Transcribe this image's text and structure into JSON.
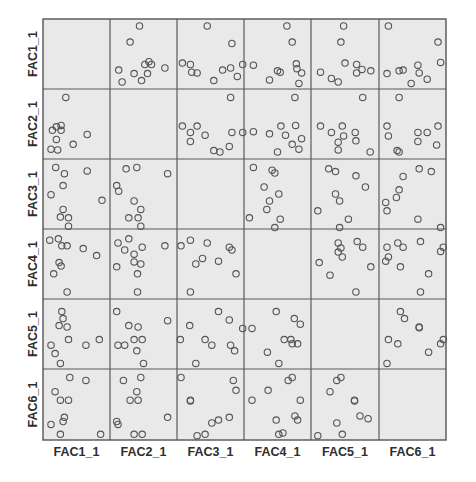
{
  "chart_data": {
    "type": "scatter",
    "subtype": "scatterplot-matrix",
    "title": "",
    "variables": [
      "FAC1_1",
      "FAC2_1",
      "FAC3_1",
      "FAC4_1",
      "FAC5_1",
      "FAC6_1"
    ],
    "x_labels": [
      "FAC1_1",
      "FAC2_1",
      "FAC3_1",
      "FAC4_1",
      "FAC5_1",
      "FAC6_1"
    ],
    "y_labels": [
      "FAC1_1",
      "FAC2_1",
      "FAC3_1",
      "FAC4_1",
      "FAC5_1",
      "FAC6_1"
    ],
    "grid": true,
    "legend": "none",
    "marker": "open-circle",
    "diagonal": "empty",
    "layout": {
      "left": 43,
      "top": 19,
      "col_edges": [
        43,
        110,
        177,
        244,
        311,
        379,
        446
      ],
      "row_edges": [
        19,
        89,
        159,
        229,
        299,
        369,
        440
      ]
    },
    "colors": {
      "cell_bg": "#e9e9e9",
      "marker": "#555555",
      "grid": "#5a5a5a",
      "label": "#2e2e2e"
    },
    "cells": {
      "0-1": [
        [
          0.13,
          0.73
        ],
        [
          0.3,
          0.33
        ],
        [
          0.44,
          0.1
        ],
        [
          0.18,
          0.9
        ],
        [
          0.36,
          0.78
        ],
        [
          0.47,
          0.88
        ],
        [
          0.52,
          0.65
        ],
        [
          0.58,
          0.61
        ],
        [
          0.62,
          0.65
        ],
        [
          0.56,
          0.78
        ],
        [
          0.82,
          0.7
        ]
      ],
      "0-2": [
        [
          0.08,
          0.63
        ],
        [
          0.2,
          0.65
        ],
        [
          0.22,
          0.76
        ],
        [
          0.3,
          0.77
        ],
        [
          0.45,
          0.1
        ],
        [
          0.55,
          0.88
        ],
        [
          0.68,
          0.73
        ],
        [
          0.82,
          0.35
        ],
        [
          0.8,
          0.7
        ],
        [
          0.9,
          0.82
        ],
        [
          0.98,
          0.65
        ]
      ],
      "0-3": [
        [
          0.14,
          0.66
        ],
        [
          0.38,
          0.87
        ],
        [
          0.5,
          0.74
        ],
        [
          0.54,
          0.76
        ],
        [
          0.64,
          0.1
        ],
        [
          0.72,
          0.33
        ],
        [
          0.78,
          0.64
        ],
        [
          0.79,
          0.71
        ],
        [
          0.86,
          0.77
        ],
        [
          0.82,
          0.92
        ]
      ],
      "0-4": [
        [
          0.14,
          0.76
        ],
        [
          0.3,
          0.85
        ],
        [
          0.4,
          0.9
        ],
        [
          0.48,
          0.1
        ],
        [
          0.44,
          0.33
        ],
        [
          0.5,
          0.63
        ],
        [
          0.67,
          0.65
        ],
        [
          0.67,
          0.77
        ],
        [
          0.75,
          0.72
        ],
        [
          0.88,
          0.74
        ]
      ],
      "0-5": [
        [
          0.14,
          0.1
        ],
        [
          0.12,
          0.78
        ],
        [
          0.3,
          0.74
        ],
        [
          0.36,
          0.73
        ],
        [
          0.58,
          0.66
        ],
        [
          0.6,
          0.77
        ],
        [
          0.72,
          0.86
        ],
        [
          0.88,
          0.33
        ],
        [
          0.92,
          0.62
        ],
        [
          0.48,
          0.92
        ]
      ],
      "1-0": [
        [
          0.34,
          0.12
        ],
        [
          0.14,
          0.59
        ],
        [
          0.2,
          0.54
        ],
        [
          0.27,
          0.52
        ],
        [
          0.27,
          0.59
        ],
        [
          0.2,
          0.72
        ],
        [
          0.12,
          0.86
        ],
        [
          0.22,
          0.87
        ],
        [
          0.45,
          0.79
        ],
        [
          0.66,
          0.65
        ]
      ],
      "1-2": [
        [
          0.08,
          0.53
        ],
        [
          0.2,
          0.62
        ],
        [
          0.3,
          0.53
        ],
        [
          0.2,
          0.75
        ],
        [
          0.42,
          0.66
        ],
        [
          0.55,
          0.88
        ],
        [
          0.64,
          0.9
        ],
        [
          0.8,
          0.12
        ],
        [
          0.82,
          0.62
        ],
        [
          0.78,
          0.82
        ],
        [
          0.98,
          0.62
        ]
      ],
      "1-3": [
        [
          0.14,
          0.61
        ],
        [
          0.38,
          0.64
        ],
        [
          0.55,
          0.53
        ],
        [
          0.62,
          0.66
        ],
        [
          0.72,
          0.79
        ],
        [
          0.77,
          0.52
        ],
        [
          0.86,
          0.71
        ],
        [
          0.82,
          0.86
        ],
        [
          0.5,
          0.9
        ],
        [
          0.76,
          0.12
        ]
      ],
      "1-4": [
        [
          0.14,
          0.53
        ],
        [
          0.3,
          0.62
        ],
        [
          0.46,
          0.53
        ],
        [
          0.48,
          0.67
        ],
        [
          0.4,
          0.76
        ],
        [
          0.4,
          0.87
        ],
        [
          0.65,
          0.62
        ],
        [
          0.66,
          0.74
        ],
        [
          0.87,
          0.9
        ],
        [
          0.76,
          0.12
        ]
      ],
      "1-5": [
        [
          0.12,
          0.53
        ],
        [
          0.14,
          0.67
        ],
        [
          0.3,
          0.12
        ],
        [
          0.58,
          0.62
        ],
        [
          0.72,
          0.62
        ],
        [
          0.58,
          0.75
        ],
        [
          0.88,
          0.53
        ],
        [
          0.86,
          0.8
        ],
        [
          0.27,
          0.88
        ],
        [
          0.3,
          0.9
        ]
      ],
      "2-0": [
        [
          0.19,
          0.12
        ],
        [
          0.32,
          0.21
        ],
        [
          0.3,
          0.38
        ],
        [
          0.12,
          0.51
        ],
        [
          0.66,
          0.17
        ],
        [
          0.88,
          0.59
        ],
        [
          0.3,
          0.72
        ],
        [
          0.26,
          0.83
        ],
        [
          0.38,
          0.84
        ],
        [
          0.38,
          0.96
        ]
      ],
      "2-1": [
        [
          0.1,
          0.38
        ],
        [
          0.13,
          0.46
        ],
        [
          0.24,
          0.14
        ],
        [
          0.4,
          0.12
        ],
        [
          0.86,
          0.21
        ],
        [
          0.36,
          0.6
        ],
        [
          0.46,
          0.72
        ],
        [
          0.28,
          0.84
        ],
        [
          0.42,
          0.84
        ],
        [
          0.46,
          0.96
        ]
      ],
      "2-3": [
        [
          0.14,
          0.12
        ],
        [
          0.42,
          0.16
        ],
        [
          0.46,
          0.2
        ],
        [
          0.3,
          0.4
        ],
        [
          0.52,
          0.5
        ],
        [
          0.38,
          0.6
        ],
        [
          0.34,
          0.72
        ],
        [
          0.08,
          0.84
        ],
        [
          0.54,
          0.86
        ],
        [
          0.46,
          0.98
        ]
      ],
      "2-4": [
        [
          0.26,
          0.14
        ],
        [
          0.36,
          0.18
        ],
        [
          0.66,
          0.24
        ],
        [
          0.8,
          0.4
        ],
        [
          0.36,
          0.5
        ],
        [
          0.42,
          0.6
        ],
        [
          0.1,
          0.74
        ],
        [
          0.55,
          0.86
        ],
        [
          0.42,
          0.98
        ]
      ],
      "2-5": [
        [
          0.1,
          0.62
        ],
        [
          0.12,
          0.74
        ],
        [
          0.26,
          0.55
        ],
        [
          0.3,
          0.44
        ],
        [
          0.36,
          0.25
        ],
        [
          0.6,
          0.14
        ],
        [
          0.78,
          0.18
        ],
        [
          0.58,
          0.86
        ],
        [
          0.92,
          0.98
        ]
      ],
      "3-0": [
        [
          0.1,
          0.16
        ],
        [
          0.23,
          0.14
        ],
        [
          0.28,
          0.24
        ],
        [
          0.36,
          0.24
        ],
        [
          0.6,
          0.28
        ],
        [
          0.8,
          0.38
        ],
        [
          0.24,
          0.48
        ],
        [
          0.27,
          0.53
        ],
        [
          0.16,
          0.64
        ],
        [
          0.36,
          0.9
        ]
      ],
      "3-1": [
        [
          0.12,
          0.2
        ],
        [
          0.28,
          0.14
        ],
        [
          0.22,
          0.3
        ],
        [
          0.36,
          0.36
        ],
        [
          0.48,
          0.26
        ],
        [
          0.36,
          0.47
        ],
        [
          0.46,
          0.5
        ],
        [
          0.1,
          0.54
        ],
        [
          0.41,
          0.64
        ],
        [
          0.82,
          0.24
        ],
        [
          0.41,
          0.9
        ]
      ],
      "3-2": [
        [
          0.06,
          0.24
        ],
        [
          0.2,
          0.16
        ],
        [
          0.45,
          0.2
        ],
        [
          0.28,
          0.5
        ],
        [
          0.38,
          0.42
        ],
        [
          0.62,
          0.46
        ],
        [
          0.78,
          0.26
        ],
        [
          0.82,
          0.3
        ],
        [
          0.88,
          0.64
        ],
        [
          0.2,
          0.9
        ]
      ],
      "3-4": [
        [
          0.4,
          0.2
        ],
        [
          0.44,
          0.27
        ],
        [
          0.4,
          0.33
        ],
        [
          0.46,
          0.4
        ],
        [
          0.68,
          0.18
        ],
        [
          0.76,
          0.26
        ],
        [
          0.12,
          0.48
        ],
        [
          0.28,
          0.66
        ],
        [
          0.88,
          0.54
        ],
        [
          0.66,
          0.9
        ]
      ],
      "3-5": [
        [
          0.28,
          0.2
        ],
        [
          0.36,
          0.26
        ],
        [
          0.62,
          0.18
        ],
        [
          0.12,
          0.26
        ],
        [
          0.14,
          0.4
        ],
        [
          0.1,
          0.46
        ],
        [
          0.32,
          0.54
        ],
        [
          0.74,
          0.64
        ],
        [
          0.92,
          0.32
        ],
        [
          0.96,
          0.26
        ],
        [
          0.62,
          0.9
        ]
      ],
      "4-0": [
        [
          0.28,
          0.18
        ],
        [
          0.3,
          0.28
        ],
        [
          0.24,
          0.38
        ],
        [
          0.36,
          0.4
        ],
        [
          0.38,
          0.58
        ],
        [
          0.12,
          0.66
        ],
        [
          0.18,
          0.78
        ],
        [
          0.64,
          0.66
        ],
        [
          0.84,
          0.58
        ],
        [
          0.26,
          0.92
        ]
      ],
      "4-1": [
        [
          0.1,
          0.18
        ],
        [
          0.28,
          0.38
        ],
        [
          0.42,
          0.4
        ],
        [
          0.86,
          0.31
        ],
        [
          0.12,
          0.66
        ],
        [
          0.22,
          0.66
        ],
        [
          0.36,
          0.58
        ],
        [
          0.48,
          0.58
        ],
        [
          0.4,
          0.74
        ],
        [
          0.5,
          0.92
        ]
      ],
      "4-2": [
        [
          0.19,
          0.38
        ],
        [
          0.05,
          0.58
        ],
        [
          0.42,
          0.58
        ],
        [
          0.52,
          0.66
        ],
        [
          0.62,
          0.18
        ],
        [
          0.78,
          0.3
        ],
        [
          0.8,
          0.66
        ],
        [
          0.86,
          0.74
        ],
        [
          0.28,
          0.92
        ],
        [
          0.98,
          0.42
        ]
      ],
      "4-3": [
        [
          0.12,
          0.42
        ],
        [
          0.48,
          0.18
        ],
        [
          0.75,
          0.28
        ],
        [
          0.84,
          0.36
        ],
        [
          0.6,
          0.58
        ],
        [
          0.7,
          0.58
        ],
        [
          0.72,
          0.64
        ],
        [
          0.8,
          0.64
        ],
        [
          0.35,
          0.76
        ],
        [
          0.52,
          0.92
        ]
      ],
      "4-5": [
        [
          0.32,
          0.18
        ],
        [
          0.38,
          0.28
        ],
        [
          0.6,
          0.4
        ],
        [
          0.6,
          0.41
        ],
        [
          0.14,
          0.58
        ],
        [
          0.28,
          0.64
        ],
        [
          0.74,
          0.76
        ],
        [
          0.92,
          0.64
        ],
        [
          0.96,
          0.58
        ],
        [
          0.12,
          0.92
        ]
      ],
      "5-0": [
        [
          0.4,
          0.12
        ],
        [
          0.64,
          0.16
        ],
        [
          0.18,
          0.32
        ],
        [
          0.26,
          0.44
        ],
        [
          0.38,
          0.44
        ],
        [
          0.32,
          0.68
        ],
        [
          0.3,
          0.74
        ],
        [
          0.12,
          0.78
        ],
        [
          0.26,
          0.92
        ],
        [
          0.86,
          0.92
        ]
      ],
      "5-1": [
        [
          0.2,
          0.16
        ],
        [
          0.46,
          0.12
        ],
        [
          0.4,
          0.32
        ],
        [
          0.3,
          0.44
        ],
        [
          0.42,
          0.44
        ],
        [
          0.1,
          0.74
        ],
        [
          0.12,
          0.78
        ],
        [
          0.86,
          0.68
        ],
        [
          0.36,
          0.92
        ],
        [
          0.48,
          0.92
        ]
      ],
      "5-2": [
        [
          0.06,
          0.12
        ],
        [
          0.2,
          0.44
        ],
        [
          0.2,
          0.45
        ],
        [
          0.84,
          0.16
        ],
        [
          0.88,
          0.3
        ],
        [
          0.52,
          0.76
        ],
        [
          0.62,
          0.72
        ],
        [
          0.78,
          0.68
        ],
        [
          0.3,
          0.94
        ],
        [
          0.42,
          0.92
        ]
      ],
      "5-3": [
        [
          0.66,
          0.16
        ],
        [
          0.72,
          0.12
        ],
        [
          0.36,
          0.3
        ],
        [
          0.12,
          0.44
        ],
        [
          0.84,
          0.44
        ],
        [
          0.48,
          0.72
        ],
        [
          0.76,
          0.66
        ],
        [
          0.8,
          0.72
        ],
        [
          0.52,
          0.92
        ],
        [
          0.58,
          0.9
        ]
      ],
      "5-4": [
        [
          0.38,
          0.16
        ],
        [
          0.44,
          0.12
        ],
        [
          0.28,
          0.32
        ],
        [
          0.64,
          0.44
        ],
        [
          0.64,
          0.45
        ],
        [
          0.72,
          0.66
        ],
        [
          0.84,
          0.7
        ],
        [
          0.38,
          0.76
        ],
        [
          0.46,
          0.92
        ],
        [
          0.1,
          0.94
        ]
      ]
    }
  }
}
